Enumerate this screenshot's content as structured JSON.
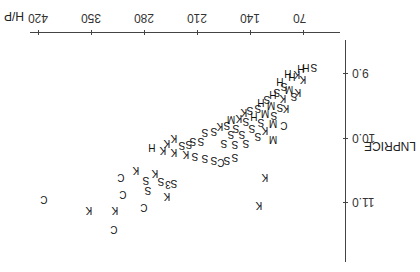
{
  "chart_data": {
    "type": "scatter",
    "orientation_note": "rendered rotated 180 degrees",
    "title": "",
    "xlabel": "H/P",
    "ylabel": "LNPRICE",
    "xticks": [
      70,
      140,
      210,
      280,
      350,
      420
    ],
    "yticks": [
      "9.0",
      "10.0",
      "11.0"
    ],
    "xlim": [
      45,
      430
    ],
    "ylim": [
      8.5,
      12.0
    ],
    "grid": false,
    "legend": null,
    "marker_symbols": [
      "S",
      "K",
      "H",
      "C",
      "M"
    ],
    "points": [
      {
        "x": 56,
        "y": 8.9,
        "m": "S"
      },
      {
        "x": 66,
        "y": 8.9,
        "m": "H"
      },
      {
        "x": 72,
        "y": 8.93,
        "m": "H"
      },
      {
        "x": 78,
        "y": 9.02,
        "m": "K"
      },
      {
        "x": 84,
        "y": 9.05,
        "m": "H"
      },
      {
        "x": 70,
        "y": 9.1,
        "m": "K"
      },
      {
        "x": 90,
        "y": 9.0,
        "m": "H"
      },
      {
        "x": 95,
        "y": 9.2,
        "m": "S"
      },
      {
        "x": 100,
        "y": 9.12,
        "m": "H"
      },
      {
        "x": 88,
        "y": 9.25,
        "m": "M"
      },
      {
        "x": 105,
        "y": 9.3,
        "m": "S"
      },
      {
        "x": 110,
        "y": 9.32,
        "m": "H"
      },
      {
        "x": 76,
        "y": 9.3,
        "m": "K"
      },
      {
        "x": 82,
        "y": 9.35,
        "m": "S"
      },
      {
        "x": 96,
        "y": 9.38,
        "m": "K"
      },
      {
        "x": 118,
        "y": 9.4,
        "m": "S"
      },
      {
        "x": 125,
        "y": 9.45,
        "m": "H"
      },
      {
        "x": 112,
        "y": 9.5,
        "m": "M"
      },
      {
        "x": 100,
        "y": 9.52,
        "m": "S"
      },
      {
        "x": 92,
        "y": 9.55,
        "m": "K"
      },
      {
        "x": 130,
        "y": 9.55,
        "m": "S"
      },
      {
        "x": 140,
        "y": 9.58,
        "m": "S"
      },
      {
        "x": 148,
        "y": 9.6,
        "m": "K"
      },
      {
        "x": 120,
        "y": 9.62,
        "m": "M"
      },
      {
        "x": 108,
        "y": 9.65,
        "m": "S"
      },
      {
        "x": 135,
        "y": 9.66,
        "m": "H"
      },
      {
        "x": 155,
        "y": 9.7,
        "m": "K"
      },
      {
        "x": 165,
        "y": 9.72,
        "m": "M"
      },
      {
        "x": 145,
        "y": 9.75,
        "m": "S"
      },
      {
        "x": 125,
        "y": 9.76,
        "m": "S"
      },
      {
        "x": 110,
        "y": 9.78,
        "m": "M"
      },
      {
        "x": 95,
        "y": 9.8,
        "m": "C"
      },
      {
        "x": 170,
        "y": 9.8,
        "m": "S"
      },
      {
        "x": 180,
        "y": 9.82,
        "m": "K"
      },
      {
        "x": 158,
        "y": 9.85,
        "m": "S"
      },
      {
        "x": 138,
        "y": 9.86,
        "m": "S"
      },
      {
        "x": 120,
        "y": 9.88,
        "m": "K"
      },
      {
        "x": 188,
        "y": 9.9,
        "m": "S"
      },
      {
        "x": 200,
        "y": 9.92,
        "m": "S"
      },
      {
        "x": 150,
        "y": 9.95,
        "m": "S"
      },
      {
        "x": 165,
        "y": 9.95,
        "m": "S"
      },
      {
        "x": 130,
        "y": 9.98,
        "m": "S"
      },
      {
        "x": 110,
        "y": 10.02,
        "m": "M"
      },
      {
        "x": 205,
        "y": 10.05,
        "m": "S"
      },
      {
        "x": 215,
        "y": 10.05,
        "m": "S"
      },
      {
        "x": 175,
        "y": 10.08,
        "m": "S"
      },
      {
        "x": 145,
        "y": 10.08,
        "m": "S"
      },
      {
        "x": 160,
        "y": 10.1,
        "m": "S"
      },
      {
        "x": 240,
        "y": 10.0,
        "m": "K"
      },
      {
        "x": 250,
        "y": 10.08,
        "m": "K"
      },
      {
        "x": 220,
        "y": 10.1,
        "m": "S"
      },
      {
        "x": 230,
        "y": 10.12,
        "m": "S"
      },
      {
        "x": 270,
        "y": 10.15,
        "m": "H"
      },
      {
        "x": 255,
        "y": 10.2,
        "m": "K"
      },
      {
        "x": 240,
        "y": 10.22,
        "m": "K"
      },
      {
        "x": 225,
        "y": 10.25,
        "m": "K"
      },
      {
        "x": 212,
        "y": 10.28,
        "m": "S"
      },
      {
        "x": 200,
        "y": 10.32,
        "m": "S"
      },
      {
        "x": 188,
        "y": 10.35,
        "m": "S"
      },
      {
        "x": 178,
        "y": 10.38,
        "m": "C"
      },
      {
        "x": 170,
        "y": 10.35,
        "m": "S"
      },
      {
        "x": 160,
        "y": 10.3,
        "m": "S"
      },
      {
        "x": 120,
        "y": 10.62,
        "m": "K"
      },
      {
        "x": 290,
        "y": 10.5,
        "m": "K"
      },
      {
        "x": 265,
        "y": 10.55,
        "m": "K"
      },
      {
        "x": 310,
        "y": 10.62,
        "m": "C"
      },
      {
        "x": 278,
        "y": 10.66,
        "m": "S"
      },
      {
        "x": 258,
        "y": 10.68,
        "m": "S"
      },
      {
        "x": 240,
        "y": 10.7,
        "m": "S"
      },
      {
        "x": 248,
        "y": 10.72,
        "m": "3"
      },
      {
        "x": 275,
        "y": 10.82,
        "m": "S"
      },
      {
        "x": 308,
        "y": 10.87,
        "m": "C"
      },
      {
        "x": 250,
        "y": 10.9,
        "m": "K"
      },
      {
        "x": 128,
        "y": 11.05,
        "m": "K"
      },
      {
        "x": 412,
        "y": 10.95,
        "m": "C"
      },
      {
        "x": 280,
        "y": 11.08,
        "m": "C"
      },
      {
        "x": 318,
        "y": 11.12,
        "m": "K"
      },
      {
        "x": 353,
        "y": 11.12,
        "m": "K"
      },
      {
        "x": 320,
        "y": 11.42,
        "m": "C"
      }
    ]
  }
}
